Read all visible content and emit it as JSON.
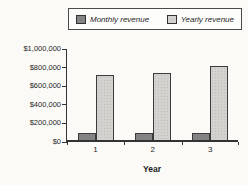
{
  "chart_data": {
    "type": "bar",
    "title": "",
    "xlabel": "Year",
    "ylabel": "",
    "categories": [
      "1",
      "2",
      "3"
    ],
    "series": [
      {
        "name": "Monthly revenue",
        "color": "#858585",
        "values": [
          80000,
          80000,
          80000
        ]
      },
      {
        "name": "Yearly revenue",
        "color": "#d3d2cf",
        "values": [
          700000,
          720000,
          800000
        ]
      }
    ],
    "ylim": [
      0,
      1000000
    ],
    "ytick_step": 200000,
    "ytick_labels": [
      "$0",
      "$200,000",
      "$400,000",
      "$600,000",
      "$800,000",
      "$1,000,000"
    ],
    "grid": false,
    "legend_position": "top",
    "bar_border_color": "#3b3b3b",
    "axis_color": "#333333",
    "background_color": "#fbfaf7"
  }
}
